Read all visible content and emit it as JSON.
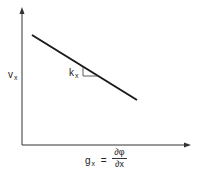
{
  "diagram": {
    "y_axis_label": {
      "main": "v",
      "sub": "x"
    },
    "x_axis_label": {
      "main": "g",
      "sub": "x",
      "equals": "=",
      "numerator": "∂φ",
      "denominator": "∂x"
    },
    "slope_label": {
      "main": "k",
      "sub": "x"
    },
    "line": {
      "x1": 32,
      "y1": 35,
      "x2": 137,
      "y2": 100
    },
    "colors": {
      "axis": "#333333",
      "line": "#1a1a1a"
    }
  }
}
